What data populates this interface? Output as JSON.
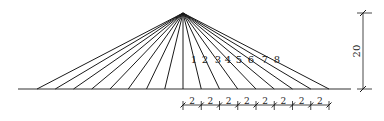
{
  "diagram": {
    "type": "fan-cable-stayed-structure",
    "apex": {
      "x": 183,
      "y": 13
    },
    "ground": {
      "y": 89,
      "x_start": 18,
      "x_end": 351
    },
    "cable_spacing_px": 18.25,
    "cables_per_side": 8,
    "cable_labels": [
      "1",
      "2",
      "3",
      "4",
      "5",
      "6",
      "7",
      "8"
    ],
    "cable_label_positions": [
      {
        "x": 194,
        "y": 63
      },
      {
        "x": 205,
        "y": 63
      },
      {
        "x": 218,
        "y": 63
      },
      {
        "x": 228,
        "y": 63
      },
      {
        "x": 239,
        "y": 63
      },
      {
        "x": 251,
        "y": 63
      },
      {
        "x": 265,
        "y": 63
      },
      {
        "x": 277,
        "y": 63
      }
    ],
    "height_dimension": {
      "label": "20",
      "x": 363,
      "y_top": 13,
      "y_bottom": 89
    },
    "spacing_dimension": {
      "y": 105,
      "segment_label": "2",
      "segments": 8
    },
    "stroke_color": "#1a1a1a",
    "ground_color": "#333333"
  }
}
